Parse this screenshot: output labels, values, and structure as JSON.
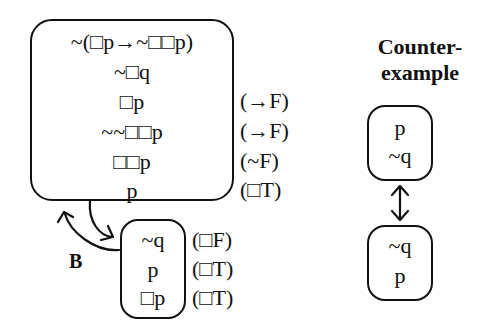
{
  "main_world": {
    "formulas": [
      "~(□p→~□□p)",
      "~□q",
      "□p",
      "~~□□p",
      "□□p",
      "p"
    ],
    "rules": [
      "",
      "",
      "(→F)",
      "(→F)",
      "(~F)",
      "(□T)"
    ]
  },
  "child_world": {
    "formulas": [
      "~q",
      "p",
      "□p"
    ],
    "rules": [
      "(□F)",
      "(□T)",
      "(□T)"
    ]
  },
  "relation_label": "B",
  "counterexample": {
    "title_line1": "Counter-",
    "title_line2": "example",
    "world1": [
      "p",
      "~q"
    ],
    "world2": [
      "~q",
      "p"
    ]
  }
}
